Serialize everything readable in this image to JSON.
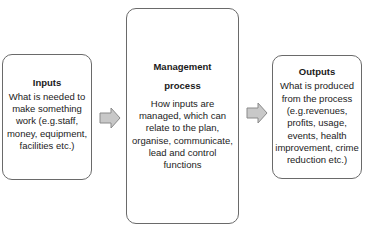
{
  "diagram": {
    "type": "flow",
    "direction": "left-to-right",
    "nodes": [
      {
        "id": "inputs",
        "title": "Inputs",
        "description": "What is needed to make something work (e.g.staff, money, equipment, facilities etc.)"
      },
      {
        "id": "management",
        "title": "Management process",
        "description": "How inputs are managed, which can relate to the plan, organise, communicate, lead and control functions"
      },
      {
        "id": "outputs",
        "title": "Outputs",
        "description": "What is produced from the process (e.g.revenues, profits, usage, events, health improvement, crime reduction etc.)"
      }
    ],
    "edges": [
      {
        "from": "inputs",
        "to": "management",
        "icon": "right-arrow-icon"
      },
      {
        "from": "management",
        "to": "outputs",
        "icon": "right-arrow-icon"
      }
    ],
    "colors": {
      "box_border": "#6a6a6a",
      "arrow_fill": "#c8c8c8",
      "arrow_stroke": "#8a8a8a",
      "text": "#1a1a1a"
    }
  }
}
